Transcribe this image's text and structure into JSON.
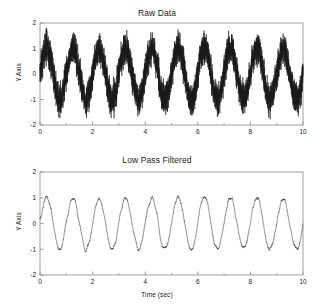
{
  "figure": {
    "background": "#ffffff",
    "line_color": "#1a1a1a",
    "axis_color": "#8a8a8a",
    "text_color": "#1a1a1a",
    "xlabel": "Time (sec)"
  },
  "panels": [
    {
      "key": "raw",
      "title": "Raw Data",
      "ylabel": "Y Axis"
    },
    {
      "key": "filtered",
      "title": "Low Pass Filtered",
      "ylabel": "Y Axis"
    }
  ],
  "chart_data": [
    {
      "type": "line",
      "title": "Raw Data",
      "xlabel": "",
      "ylabel": "Y Axis",
      "xlim": [
        0,
        10
      ],
      "ylim": [
        -2,
        2
      ],
      "xticks": [
        0,
        2,
        4,
        6,
        8,
        10
      ],
      "xticklabels": [
        "0",
        "2",
        "4",
        "6",
        "8",
        "10"
      ],
      "xminorticks": [
        1,
        3,
        5,
        7,
        9
      ],
      "yticks": [
        -2,
        -1,
        0,
        1,
        2
      ],
      "yticklabels": [
        "-2",
        "-1",
        "0",
        "1",
        "2"
      ],
      "grid": false,
      "legend": null,
      "series": [
        {
          "name": "raw signal",
          "description": "1 Hz sinusoid of amplitude 1.0 plus broadband noise, peaks to about +1.45 and troughs to about -1.45",
          "signal": {
            "kind": "sine_plus_noise",
            "amplitude": 1.0,
            "frequency_hz": 1.0,
            "phase_rad": 0.0,
            "offset": 0.0,
            "noise_amplitude": 0.3,
            "noise_seed": 17,
            "sample_rate_hz": 500
          }
        }
      ]
    },
    {
      "type": "line",
      "title": "Low Pass Filtered",
      "xlabel": "Time (sec)",
      "ylabel": "Y Axis",
      "xlim": [
        0,
        10
      ],
      "ylim": [
        -2,
        2
      ],
      "xticks": [
        0,
        2,
        4,
        6,
        8,
        10
      ],
      "xticklabels": [
        "0",
        "2",
        "4",
        "6",
        "8",
        "10"
      ],
      "xminorticks": [
        1,
        3,
        5,
        7,
        9
      ],
      "yticks": [
        -2,
        -1,
        0,
        1,
        2
      ],
      "yticklabels": [
        "-2",
        "-1",
        "0",
        "1",
        "2"
      ],
      "grid": false,
      "legend": null,
      "series": [
        {
          "name": "low pass filtered signal",
          "description": "Same 1 Hz sinusoid after low pass filtering, smooth with slight residual ripple, peaks about +1.12 and troughs about -1.12",
          "signal": {
            "kind": "sine_plus_noise",
            "amplitude": 1.0,
            "frequency_hz": 1.0,
            "phase_rad": 0.0,
            "offset": 0.0,
            "noise_amplitude": 0.3,
            "noise_seed": 17,
            "sample_rate_hz": 500,
            "lowpass_smoothing_window": 45
          }
        }
      ]
    }
  ]
}
